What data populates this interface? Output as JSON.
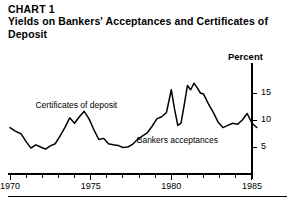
{
  "header": {
    "chart_number": "CHART 1",
    "title": "Yields on Bankers' Acceptances and Certificates of Deposit"
  },
  "chart_data": {
    "type": "line",
    "title": "Yields on Bankers' Acceptances and Certificates of Deposit",
    "xlabel": "",
    "ylabel": "Percent",
    "unit_label": "Percent",
    "xlim": [
      1970,
      1985.6
    ],
    "ylim": [
      0,
      18
    ],
    "yticks": [
      5,
      10,
      15
    ],
    "ytick_labels": [
      "5",
      "10",
      "15"
    ],
    "xticks": [
      1970,
      1971,
      1972,
      1973,
      1974,
      1975,
      1976,
      1977,
      1978,
      1979,
      1980,
      1981,
      1982,
      1983,
      1984,
      1985
    ],
    "xtick_labels_shown": [
      "1970",
      "1975",
      "1980",
      "1985"
    ],
    "xtick_labels_shown_at": [
      1970,
      1975,
      1980,
      1985
    ],
    "grid": false,
    "legend_position": "inline-annotation",
    "annotations": [
      {
        "text": "Certificates of deposit",
        "x": 1972.2,
        "y": 12.6
      },
      {
        "text": "Bankers acceptances",
        "x": 1978.6,
        "y": 6.2
      }
    ],
    "series": [
      {
        "name": "Yield",
        "color": "#000000",
        "x": [
          1970.0,
          1970.3,
          1970.7,
          1971.0,
          1971.3,
          1971.6,
          1971.9,
          1972.2,
          1972.5,
          1972.8,
          1973.1,
          1973.4,
          1973.7,
          1974.0,
          1974.3,
          1974.6,
          1974.9,
          1975.2,
          1975.5,
          1975.8,
          1976.1,
          1976.4,
          1976.7,
          1977.0,
          1977.3,
          1977.6,
          1977.9,
          1978.2,
          1978.5,
          1978.8,
          1979.1,
          1979.4,
          1979.7,
          1980.0,
          1980.2,
          1980.4,
          1980.6,
          1980.8,
          1981.0,
          1981.2,
          1981.4,
          1981.6,
          1981.8,
          1982.0,
          1982.3,
          1982.6,
          1982.9,
          1983.2,
          1983.5,
          1983.8,
          1984.1,
          1984.4,
          1984.7,
          1985.0,
          1985.3
        ],
        "y": [
          8.6,
          8.0,
          7.4,
          6.0,
          4.8,
          5.4,
          5.0,
          4.6,
          5.2,
          5.6,
          7.0,
          8.6,
          10.4,
          9.4,
          10.6,
          11.6,
          10.2,
          8.2,
          6.4,
          6.6,
          5.6,
          5.4,
          5.3,
          4.9,
          5.0,
          5.5,
          6.4,
          7.0,
          7.6,
          8.8,
          10.2,
          10.6,
          11.4,
          15.6,
          12.0,
          9.0,
          9.4,
          12.8,
          16.4,
          15.6,
          16.8,
          16.0,
          15.0,
          14.8,
          13.0,
          11.4,
          9.6,
          8.6,
          9.0,
          9.4,
          9.2,
          10.0,
          11.2,
          9.4,
          8.6
        ]
      }
    ]
  },
  "axis": {
    "unit_label": "Percent",
    "y_labels": [
      "15",
      "10",
      "5"
    ],
    "x_labels": [
      "1970",
      "1975",
      "1980",
      "1985"
    ]
  },
  "annotations": {
    "cd_label": "Certificates of deposit",
    "ba_label": "Bankers acceptances"
  }
}
